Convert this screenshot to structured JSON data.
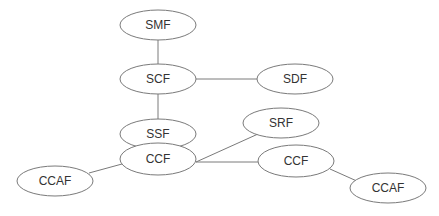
{
  "diagram": {
    "type": "network-graph",
    "nodes": [
      {
        "id": "smf",
        "label": "SMF",
        "cx": 158,
        "cy": 25,
        "rx": 38,
        "ry": 15
      },
      {
        "id": "scf",
        "label": "SCF",
        "cx": 158,
        "cy": 79,
        "rx": 38,
        "ry": 15
      },
      {
        "id": "sdf",
        "label": "SDF",
        "cx": 295,
        "cy": 79,
        "rx": 38,
        "ry": 15
      },
      {
        "id": "ssf",
        "label": "SSF",
        "cx": 158,
        "cy": 134,
        "rx": 38,
        "ry": 15
      },
      {
        "id": "ccf",
        "label": "CCF",
        "cx": 158,
        "cy": 159,
        "rx": 38,
        "ry": 16
      },
      {
        "id": "srf",
        "label": "SRF",
        "cx": 281,
        "cy": 123,
        "rx": 38,
        "ry": 15
      },
      {
        "id": "ccf2",
        "label": "CCF",
        "cx": 296,
        "cy": 161,
        "rx": 38,
        "ry": 16
      },
      {
        "id": "ccaf1",
        "label": "CCAF",
        "cx": 55,
        "cy": 181,
        "rx": 38,
        "ry": 15
      },
      {
        "id": "ccaf2",
        "label": "CCAF",
        "cx": 388,
        "cy": 188,
        "rx": 38,
        "ry": 15
      }
    ],
    "edges": [
      {
        "from": "smf",
        "to": "scf",
        "x1": 158,
        "y1": 40,
        "x2": 158,
        "y2": 64
      },
      {
        "from": "scf",
        "to": "sdf",
        "x1": 196,
        "y1": 79,
        "x2": 257,
        "y2": 79
      },
      {
        "from": "scf",
        "to": "ssf",
        "x1": 158,
        "y1": 94,
        "x2": 158,
        "y2": 119
      },
      {
        "from": "ccf",
        "to": "srf",
        "x1": 196,
        "y1": 162,
        "x2": 258,
        "y2": 134
      },
      {
        "from": "ccf",
        "to": "ccf2",
        "x1": 196,
        "y1": 162,
        "x2": 258,
        "y2": 162
      },
      {
        "from": "ccf",
        "to": "ccaf1",
        "x1": 122,
        "y1": 164,
        "x2": 89,
        "y2": 173
      },
      {
        "from": "ccf2",
        "to": "ccaf2",
        "x1": 330,
        "y1": 169,
        "x2": 359,
        "y2": 182
      }
    ],
    "colors": {
      "stroke": "#7a7a7a",
      "text": "#333333",
      "fill": "#ffffff"
    }
  }
}
